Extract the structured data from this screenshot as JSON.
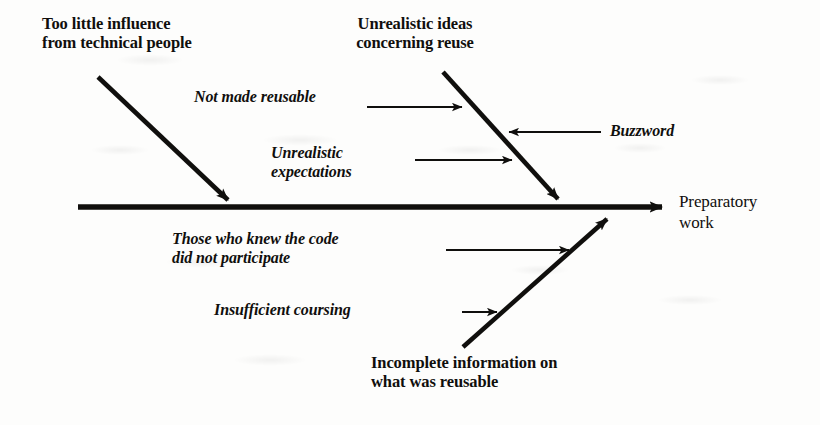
{
  "diagram": {
    "type": "fishbone-ishikawa",
    "effect": {
      "label": "Preparatory\nwork"
    },
    "major_causes": [
      {
        "id": "too-little-influence",
        "label": "Too little influence\nfrom technical people",
        "position": "upper-left"
      },
      {
        "id": "unrealistic-ideas",
        "label": "Unrealistic ideas\nconcerning reuse",
        "position": "upper-right"
      },
      {
        "id": "incomplete-information",
        "label": "Incomplete information on\nwhat was reusable",
        "position": "lower-right"
      }
    ],
    "sub_causes": [
      {
        "id": "not-made-reusable",
        "label": "Not made reusable",
        "direction": "right",
        "attaches_to": "unrealistic-ideas"
      },
      {
        "id": "unrealistic-expectations",
        "label": "Unrealistic\nexpectations",
        "direction": "right",
        "attaches_to": "unrealistic-ideas"
      },
      {
        "id": "buzzword",
        "label": "Buzzword",
        "direction": "left",
        "attaches_to": "unrealistic-ideas"
      },
      {
        "id": "those-who-knew-the-code",
        "label": "Those who knew the code\ndid not participate",
        "direction": "right",
        "attaches_to": "incomplete-information"
      },
      {
        "id": "insufficient-coursing",
        "label": "Insufficient coursing",
        "direction": "right",
        "attaches_to": "incomplete-information"
      }
    ],
    "colors": {
      "ink": "#100f0d",
      "background": "#fdfdfc"
    }
  }
}
